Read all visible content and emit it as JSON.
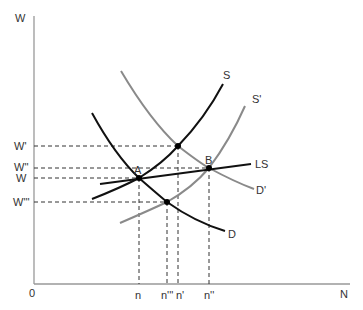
{
  "diagram": {
    "axes": {
      "y_label": "W",
      "x_label": "N",
      "origin_label": "0"
    },
    "wage_levels": [
      {
        "id": "w_prime",
        "label": "W'",
        "y": 146,
        "x_end": 178
      },
      {
        "id": "w_double",
        "label": "W''",
        "y": 168,
        "x_end": 209
      },
      {
        "id": "w",
        "label": "W",
        "y": 178,
        "x_end": 139
      },
      {
        "id": "w_triple",
        "label": "W'''",
        "y": 202,
        "x_end": 167
      }
    ],
    "employment_levels": [
      {
        "id": "n",
        "label": "n",
        "x": 139,
        "y_start": 178
      },
      {
        "id": "n_triple",
        "label": "n'''",
        "x": 167,
        "y_start": 202
      },
      {
        "id": "n_prime",
        "label": "n'",
        "x": 178,
        "y_start": 146
      },
      {
        "id": "n_double",
        "label": "n''",
        "x": 209,
        "y_start": 168
      }
    ],
    "curves": [
      {
        "id": "S",
        "label": "S",
        "color": "#111111"
      },
      {
        "id": "S_prime",
        "label": "S'",
        "color": "#8a8a8a"
      },
      {
        "id": "D",
        "label": "D",
        "color": "#111111"
      },
      {
        "id": "D_prime",
        "label": "D'",
        "color": "#8a8a8a"
      },
      {
        "id": "LS",
        "label": "LS",
        "color": "#111111"
      }
    ],
    "points": [
      {
        "id": "A",
        "label": "A",
        "x": 139,
        "y": 178
      },
      {
        "id": "B",
        "label": "B",
        "x": 209,
        "y": 168
      },
      {
        "id": "P1",
        "label": "",
        "x": 178,
        "y": 146
      },
      {
        "id": "P2",
        "label": "",
        "x": 167,
        "y": 202
      }
    ]
  }
}
